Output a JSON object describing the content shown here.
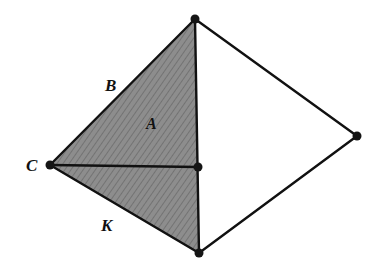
{
  "diagram": {
    "type": "geometric-figure",
    "colors": {
      "background": "#ffffff",
      "stroke": "#111111",
      "shaded_fill": "#8a8a8a",
      "hatch": "#6e6e6e"
    },
    "vertices": {
      "top": {
        "x": 195,
        "y": 19
      },
      "left": {
        "x": 50,
        "y": 165
      },
      "middle": {
        "x": 198,
        "y": 167
      },
      "bottom": {
        "x": 199,
        "y": 253
      },
      "right": {
        "x": 357,
        "y": 136
      }
    },
    "labels": {
      "B": "B",
      "A": "A",
      "C": "C",
      "K": "K"
    },
    "shaded_region": "triangle top-left-bottom"
  }
}
